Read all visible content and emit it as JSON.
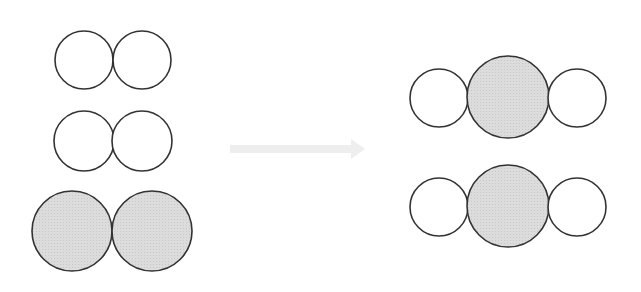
{
  "diagram": {
    "colors": {
      "background": "#ffffff",
      "outline": "#333333",
      "shaded_fill": "#d9d9d9",
      "unshaded_fill": "#ffffff",
      "arrow": "#eeeeee"
    },
    "reactants": [
      {
        "id": "small-molecule-1",
        "atoms": [
          {
            "cx": 84,
            "cy": 60,
            "r": 29,
            "shaded": false
          },
          {
            "cx": 142,
            "cy": 60,
            "r": 29,
            "shaded": false
          }
        ]
      },
      {
        "id": "small-molecule-2",
        "atoms": [
          {
            "cx": 84,
            "cy": 141,
            "r": 30,
            "shaded": false
          },
          {
            "cx": 142,
            "cy": 141,
            "r": 30,
            "shaded": false
          }
        ]
      },
      {
        "id": "large-molecule",
        "atoms": [
          {
            "cx": 72,
            "cy": 231,
            "r": 40,
            "shaded": true
          },
          {
            "cx": 152,
            "cy": 231,
            "r": 40,
            "shaded": true
          }
        ]
      }
    ],
    "arrow": {
      "x1": 230,
      "y1": 149,
      "x2": 365,
      "y2": 149
    },
    "products": [
      {
        "id": "product-molecule-1",
        "atoms": [
          {
            "cx": 439,
            "cy": 98,
            "r": 29,
            "shaded": false
          },
          {
            "cx": 508,
            "cy": 97,
            "r": 41,
            "shaded": true
          },
          {
            "cx": 577,
            "cy": 98,
            "r": 29,
            "shaded": false
          }
        ]
      },
      {
        "id": "product-molecule-2",
        "atoms": [
          {
            "cx": 439,
            "cy": 207,
            "r": 29,
            "shaded": false
          },
          {
            "cx": 508,
            "cy": 206,
            "r": 41,
            "shaded": true
          },
          {
            "cx": 577,
            "cy": 207,
            "r": 29,
            "shaded": false
          }
        ]
      }
    ]
  }
}
